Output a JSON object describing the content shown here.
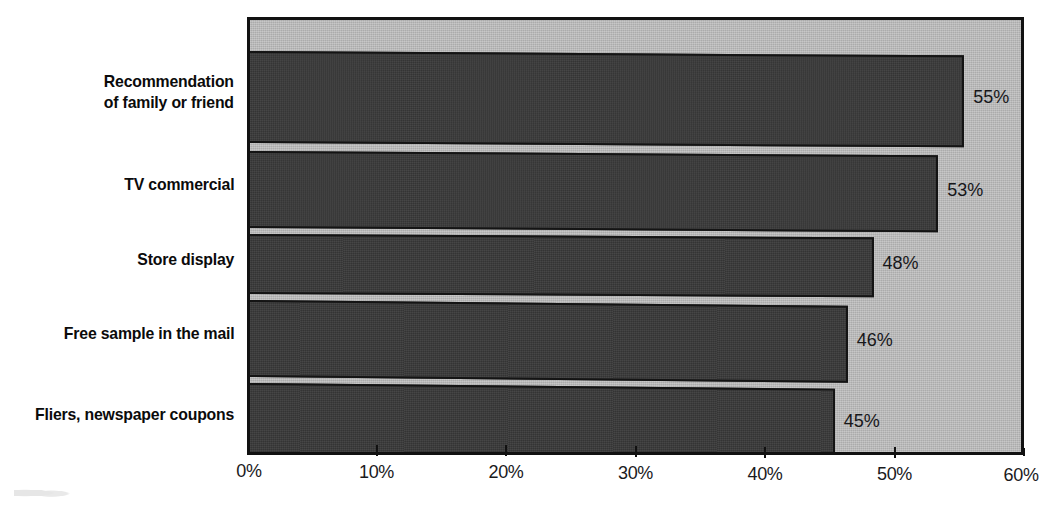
{
  "chart_data": {
    "type": "bar",
    "orientation": "horizontal",
    "title": "",
    "subtitle": "",
    "xlabel": "",
    "ylabel": "",
    "categories": [
      "Recommendation\nof family or friend",
      "TV commercial",
      "Store display",
      "Free sample in the mail",
      "Fliers, newspaper coupons"
    ],
    "category_lines": [
      [
        "Recommendation",
        "of family or friend"
      ],
      [
        "TV commercial"
      ],
      [
        "Store display"
      ],
      [
        "Free sample in the mail"
      ],
      [
        "Fliers, newspaper coupons"
      ]
    ],
    "values": [
      55,
      53,
      48,
      46,
      45
    ],
    "value_labels": [
      "55%",
      "53%",
      "48%",
      "46%",
      "45%"
    ],
    "xlim": [
      0,
      60
    ],
    "xticks": [
      0,
      10,
      20,
      30,
      40,
      50,
      60
    ],
    "xtick_labels": [
      "0%",
      "10%",
      "20%",
      "30%",
      "40%",
      "50%",
      "60%"
    ],
    "grid": false,
    "legend": false,
    "legend_position": "none",
    "colors": {
      "bar_fill": "#3a3a3a",
      "bar_border": "#141414",
      "plot_background": "#b9b9b9",
      "plot_border": "#111111",
      "page_background": "#ffffff",
      "text": "#111111"
    }
  },
  "axis": {
    "ticks": [
      {
        "label": "0%"
      },
      {
        "label": "10%"
      },
      {
        "label": "20%"
      },
      {
        "label": "30%"
      },
      {
        "label": "40%"
      },
      {
        "label": "50%"
      },
      {
        "label": "60%"
      }
    ]
  },
  "series": [
    {
      "category_line1": "Recommendation",
      "category_line2": "of family or friend",
      "value_label": "55%",
      "value": 55
    },
    {
      "category_line1": "TV commercial",
      "category_line2": "",
      "value_label": "53%",
      "value": 53
    },
    {
      "category_line1": "Store display",
      "category_line2": "",
      "value_label": "48%",
      "value": 48
    },
    {
      "category_line1": "Free sample in the mail",
      "category_line2": "",
      "value_label": "46%",
      "value": 46
    },
    {
      "category_line1": "Fliers, newspaper coupons",
      "category_line2": "",
      "value_label": "45%",
      "value": 45
    }
  ]
}
